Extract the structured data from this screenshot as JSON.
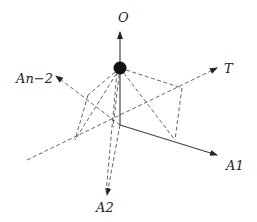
{
  "diagram": {
    "type": "3d-axes-pyramid",
    "point": {
      "label": "O",
      "x": 120,
      "y": 68
    },
    "origin": {
      "x": 120,
      "y": 125
    },
    "axes": [
      {
        "id": "O",
        "label": "O",
        "style": "solid",
        "from": [
          120,
          62
        ],
        "to": [
          120,
          31
        ],
        "label_pos": [
          119,
          22
        ]
      },
      {
        "id": "A1",
        "label": "A1",
        "style": "solid",
        "from": [
          120,
          125
        ],
        "to": [
          218,
          155
        ],
        "label_pos": [
          227,
          170
        ]
      },
      {
        "id": "A2",
        "label": "A2",
        "style": "dashed",
        "from": [
          120,
          125
        ],
        "to": [
          107,
          196
        ],
        "label_pos": [
          97,
          212
        ]
      },
      {
        "id": "An-2",
        "label": "An−2",
        "style": "dashed",
        "from": [
          120,
          125
        ],
        "to": [
          55,
          75
        ],
        "label_pos": [
          16,
          83
        ]
      },
      {
        "id": "T",
        "label": "T",
        "style": "dashed",
        "from": [
          27,
          160
        ],
        "to": [
          218,
          68
        ],
        "label_pos": [
          225,
          73
        ]
      }
    ],
    "vertical_axis": {
      "from": [
        120,
        74
      ],
      "to": [
        120,
        125
      ]
    },
    "pyramid_edges": [
      {
        "from": [
          120,
          68
        ],
        "to": [
          182,
          88
        ]
      },
      {
        "from": [
          120,
          68
        ],
        "to": [
          175,
          140
        ]
      },
      {
        "from": [
          120,
          68
        ],
        "to": [
          75,
          140
        ]
      },
      {
        "from": [
          120,
          68
        ],
        "to": [
          88,
          95
        ]
      },
      {
        "from": [
          120,
          68
        ],
        "to": [
          110,
          190
        ]
      },
      {
        "from": [
          120,
          68
        ],
        "to": [
          113,
          127
        ]
      }
    ],
    "base_edges": [
      {
        "from": [
          88,
          95
        ],
        "to": [
          75,
          140
        ]
      },
      {
        "from": [
          182,
          88
        ],
        "to": [
          175,
          140
        ]
      }
    ],
    "colors": {
      "line": "#444444",
      "dot": "#111111",
      "text": "#222222"
    }
  }
}
